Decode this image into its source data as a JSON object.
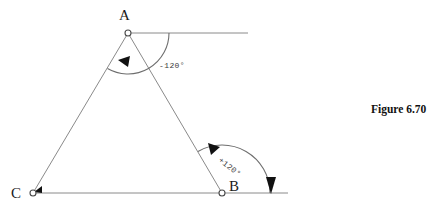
{
  "figure": {
    "caption": "Figure 6.70",
    "caption_x": 371,
    "caption_y": 110,
    "background": "#ffffff",
    "line_color": "#8a8a8a",
    "arc_color": "#6e6e6e",
    "label_color": "#1b1b1b",
    "arrow_color": "#111111"
  },
  "vertices": {
    "A": {
      "label": "A",
      "x": 128,
      "y": 33,
      "label_x": 119,
      "label_y": 20
    },
    "B": {
      "label": "B",
      "x": 222,
      "y": 193,
      "label_x": 229,
      "label_y": 191
    },
    "C": {
      "label": "C",
      "x": 33,
      "y": 193,
      "label_x": 11,
      "label_y": 198
    }
  },
  "edges": [
    {
      "name": "edge-a-to-c",
      "from": "A",
      "to": "C"
    },
    {
      "name": "edge-a-to-b",
      "from": "A",
      "to": "B"
    },
    {
      "name": "baseline-c-to-b",
      "from": "C",
      "to": "B"
    }
  ],
  "rays": {
    "horizontal_from_a": {
      "x1": 128,
      "y1": 33,
      "x2": 248,
      "y2": 33
    },
    "baseline_extension": {
      "x1": 222,
      "y1": 193,
      "x2": 288,
      "y2": 193
    }
  },
  "angles": [
    {
      "name": "angle-at-a",
      "vertex": "A",
      "label": "-120°",
      "label_x": 159,
      "label_y": 68,
      "label_rotation": 0,
      "radius": 41,
      "start_deg": 0,
      "end_deg": 120,
      "sense": "negative"
    },
    {
      "name": "angle-at-b",
      "vertex": "B",
      "label": "+120°",
      "label_x": 218,
      "label_y": 161,
      "label_rotation": 38,
      "radius": 48,
      "start_deg": 120,
      "end_deg": 0,
      "sense": "positive"
    }
  ],
  "arrowheads": [
    {
      "name": "arrowhead-toward-c-on-ac",
      "x": 118,
      "y": 60,
      "angle_deg": 240,
      "size": 9
    },
    {
      "name": "arrowhead-at-c",
      "x": 36,
      "y": 190,
      "angle_deg": 240,
      "size": 7
    },
    {
      "name": "arrowhead-toward-a-on-ba",
      "x": 211,
      "y": 147,
      "angle_deg": 120,
      "size": 9
    },
    {
      "name": "arrowhead-down-at-baseline",
      "x": 271,
      "y": 193,
      "angle_deg": 90,
      "size": 10
    }
  ]
}
